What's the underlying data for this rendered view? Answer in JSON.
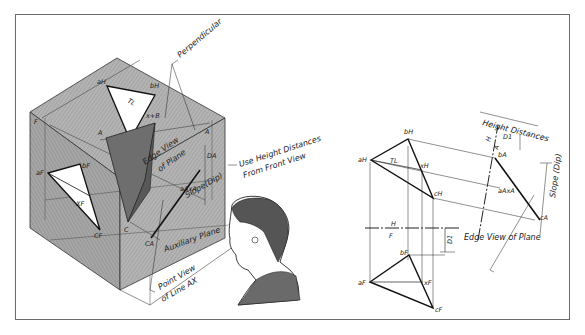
{
  "figure": {
    "pictorial": {
      "leaders": {
        "perpendicular": "Perpendicular",
        "use_height": "Use Height Distances",
        "from_front": "From Front View",
        "edge_view": "Edge View",
        "of_plane": "of Plane",
        "slope": "Slope(Dip)",
        "auxiliary_plane": "Auxiliary Plane",
        "point_view": "Point View",
        "of_line_ax": "of Line AX"
      },
      "points": {
        "aH": "aH",
        "bH": "bH",
        "tl": "TL",
        "xb": "x+B",
        "a_top": "A",
        "ax_top": "H",
        "f": "F",
        "a_left": "A",
        "c_ax": "C+X",
        "dA": "DA",
        "aF": "aF",
        "bF": "bF",
        "xF": "XF",
        "cF": "CF",
        "c": "C",
        "cA": "CA",
        "aAxA": "aAxA",
        "one": "1"
      }
    },
    "orthographic": {
      "height_distances": "Height Distances",
      "d1_top": "D1",
      "d1_bottom": "D1",
      "slope": "Slope (Dip)",
      "edge_view_of_plane": "Edge View of Plane",
      "fold_ha": {
        "h": "H",
        "a": "A"
      },
      "fold_hf": {
        "h": "H",
        "f": "F"
      },
      "top_view": {
        "a": "aH",
        "b": "bH",
        "x": "xH",
        "c": "cH",
        "tl": "TL"
      },
      "aux_view": {
        "b": "bA",
        "ax": "aAxA",
        "c": "cA"
      },
      "front_view": {
        "a": "aF",
        "b": "bF",
        "x": "xF",
        "c": "cF"
      }
    }
  },
  "colors": {
    "frame": "#6b6b6b",
    "cube_shade": "#a9a9a9",
    "cube_dark": "#6e6e6e",
    "ink": "#1e1e1e"
  }
}
